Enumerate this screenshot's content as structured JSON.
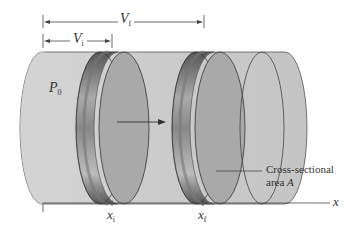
{
  "diagram": {
    "type": "piston-cylinder expansion",
    "labels": {
      "v_final": {
        "main": "V",
        "sub": "f"
      },
      "v_initial": {
        "main": "V",
        "sub": "i"
      },
      "pressure": {
        "main": "P",
        "sub": "0"
      },
      "x_initial": {
        "main": "x",
        "sub": "i"
      },
      "x_final": {
        "main": "x",
        "sub": "f"
      },
      "x_axis": "x",
      "cross_section_line1": "Cross-sectional",
      "cross_section_line2_prefix": "area ",
      "cross_section_symbol": "A"
    },
    "colors": {
      "cylinder_fill": "#c9c9c9",
      "cylinder_end": "#bdbdbd",
      "piston_face": "#a8a8a8",
      "piston_rim_dark": "#555555",
      "piston_rim_light": "#9a9a9a",
      "line": "#444444",
      "text": "#333333"
    }
  }
}
